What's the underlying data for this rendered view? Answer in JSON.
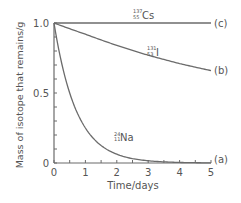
{
  "chart_data": {
    "type": "line",
    "title": "",
    "xlabel": "Time/days",
    "ylabel": "Mass of isotope that remains/g",
    "xlim": [
      0,
      5
    ],
    "ylim": [
      0,
      1.0
    ],
    "x_ticks": [
      "0",
      "1",
      "2",
      "3",
      "4",
      "5"
    ],
    "y_ticks": [
      "0",
      "0.5",
      "1.0"
    ],
    "grid": false,
    "legend": "inline labels",
    "series": [
      {
        "name": "(a)",
        "isotope": "Na",
        "mass_number": "24",
        "atomic_number": "11",
        "x": [
          0,
          0.5,
          1,
          1.5,
          2,
          2.5,
          3,
          3.5,
          4,
          4.5,
          5
        ],
        "values": [
          1.0,
          0.5,
          0.25,
          0.125,
          0.063,
          0.031,
          0.016,
          0.008,
          0.004,
          0.002,
          0.001
        ]
      },
      {
        "name": "(b)",
        "isotope": "I",
        "mass_number": "131",
        "atomic_number": "53",
        "x": [
          0,
          1,
          2,
          3,
          4,
          5
        ],
        "values": [
          1.0,
          0.92,
          0.84,
          0.77,
          0.71,
          0.66
        ]
      },
      {
        "name": "(c)",
        "isotope": "Cs",
        "mass_number": "137",
        "atomic_number": "55",
        "x": [
          0,
          1,
          2,
          3,
          4,
          5
        ],
        "values": [
          1.0,
          1.0,
          1.0,
          1.0,
          1.0,
          1.0
        ]
      }
    ]
  },
  "labels": {
    "cs_mass": "137",
    "cs_atomic": "55",
    "cs_symbol": "Cs",
    "cs_tag": "(c)",
    "i_mass": "131",
    "i_atomic": "53",
    "i_symbol": "I",
    "i_tag": "(b)",
    "na_mass": "24",
    "na_atomic": "11",
    "na_symbol": "Na",
    "na_tag": "(a)"
  },
  "colors": {
    "line": "#6b6b6b",
    "text": "#555555"
  }
}
